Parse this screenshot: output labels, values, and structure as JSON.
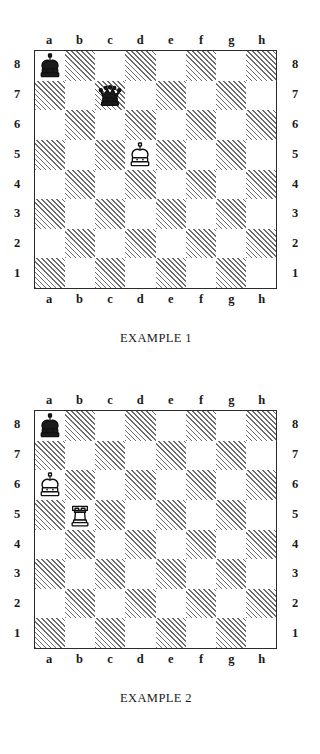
{
  "page": {
    "background": "#ffffff",
    "ink": "#1a1a1a",
    "hatch_color": "#6d6d6d",
    "border_color": "#2b2b2b"
  },
  "files": [
    "a",
    "b",
    "c",
    "d",
    "e",
    "f",
    "g",
    "h"
  ],
  "ranks": [
    "8",
    "7",
    "6",
    "5",
    "4",
    "3",
    "2",
    "1"
  ],
  "diagrams": [
    {
      "id": "example-1",
      "caption": "EXAMPLE 1",
      "files_top": [
        "a",
        "b",
        "c",
        "d",
        "e",
        "f",
        "g",
        "h"
      ],
      "files_bottom": [
        "a",
        "b",
        "c",
        "d",
        "e",
        "f",
        "g",
        "h"
      ],
      "ranks_left": [
        "8",
        "7",
        "6",
        "5",
        "4",
        "3",
        "2",
        "1"
      ],
      "ranks_right": [
        "8",
        "7",
        "6",
        "5",
        "4",
        "3",
        "2",
        "1"
      ],
      "pieces": [
        {
          "square": "a8",
          "file": 0,
          "rank": 0,
          "color": "black",
          "type": "king",
          "glyph": "black-king-icon"
        },
        {
          "square": "c7",
          "file": 2,
          "rank": 1,
          "color": "black",
          "type": "queen",
          "glyph": "black-queen-icon"
        },
        {
          "square": "d5",
          "file": 3,
          "rank": 3,
          "color": "white",
          "type": "king",
          "glyph": "white-king-icon"
        }
      ]
    },
    {
      "id": "example-2",
      "caption": "EXAMPLE 2",
      "files_top": [
        "a",
        "b",
        "c",
        "d",
        "e",
        "f",
        "g",
        "h"
      ],
      "files_bottom": [
        "a",
        "b",
        "c",
        "d",
        "e",
        "f",
        "g",
        "h"
      ],
      "ranks_left": [
        "8",
        "7",
        "6",
        "5",
        "4",
        "3",
        "2",
        "1"
      ],
      "ranks_right": [
        "8",
        "7",
        "6",
        "5",
        "4",
        "3",
        "2",
        "1"
      ],
      "pieces": [
        {
          "square": "a8",
          "file": 0,
          "rank": 0,
          "color": "black",
          "type": "king",
          "glyph": "black-king-icon"
        },
        {
          "square": "a6",
          "file": 0,
          "rank": 2,
          "color": "white",
          "type": "king",
          "glyph": "white-king-icon"
        },
        {
          "square": "b5",
          "file": 1,
          "rank": 3,
          "color": "white",
          "type": "rook",
          "glyph": "white-rook-icon"
        }
      ]
    }
  ]
}
